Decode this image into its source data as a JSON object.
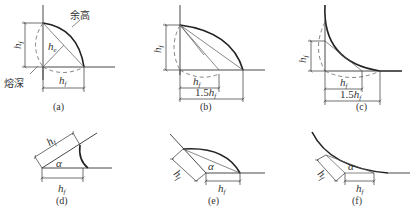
{
  "figure": {
    "panels": [
      {
        "id": "a",
        "caption": "(a)",
        "labels": {
          "height": "h",
          "height_sub": "f",
          "width": "h",
          "width_sub": "f",
          "throat": "h",
          "throat_sub": "e",
          "reinforcement": "余高",
          "penetration": "熔深"
        }
      },
      {
        "id": "b",
        "caption": "(b)",
        "labels": {
          "height": "h",
          "height_sub": "f",
          "width": "h",
          "width_sub": "f",
          "width2_prefix": "1.5",
          "width2": "h",
          "width2_sub": "f"
        }
      },
      {
        "id": "c",
        "caption": "(c)",
        "labels": {
          "height": "h",
          "height_sub": "f",
          "width": "h",
          "width_sub": "f",
          "width2_prefix": "1.5",
          "width2": "h",
          "width2_sub": "f"
        }
      },
      {
        "id": "d",
        "caption": "(d)",
        "labels": {
          "leg1": "h",
          "leg1_sub": "f",
          "leg2": "h",
          "leg2_sub": "f",
          "angle": "α"
        }
      },
      {
        "id": "e",
        "caption": "(e)",
        "labels": {
          "leg1": "h",
          "leg1_sub": "f",
          "leg2": "h",
          "leg2_sub": "f",
          "angle": "α"
        }
      },
      {
        "id": "f",
        "caption": "(f)",
        "labels": {
          "leg1": "h",
          "leg1_sub": "f",
          "leg2": "h",
          "leg2_sub": "f",
          "angle": "α"
        }
      }
    ]
  }
}
